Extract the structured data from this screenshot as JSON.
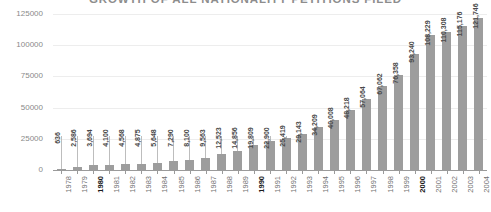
{
  "chart_data": {
    "type": "bar",
    "title": "GROWTH OF ALL NATIONALITY PETITIONS FILED",
    "xlabel": "",
    "ylabel": "",
    "ylim": [
      0,
      125000
    ],
    "yticks": [
      0,
      25000,
      50000,
      75000,
      100000,
      125000
    ],
    "ytick_labels": [
      "0",
      "25000",
      "50000",
      "75000",
      "100000",
      "125000"
    ],
    "grid": true,
    "legend": "none",
    "bar_color": "#9d9d9d",
    "categories": [
      "1978",
      "1979",
      "1980",
      "1981",
      "1982",
      "1983",
      "1984",
      "1985",
      "1986",
      "1987",
      "1988",
      "1989",
      "1990",
      "1991",
      "1992",
      "1993",
      "1994",
      "1995",
      "1996",
      "1997",
      "1998",
      "1999",
      "2000",
      "2001",
      "2002",
      "2003",
      "2004"
    ],
    "emphasized_categories": [
      "1980",
      "1990",
      "2000"
    ],
    "values": [
      636,
      2586,
      3694,
      4100,
      4568,
      4875,
      5648,
      7290,
      8100,
      9563,
      12523,
      14856,
      19809,
      22900,
      25419,
      29143,
      34209,
      40008,
      48218,
      57064,
      67062,
      76358,
      93240,
      108229,
      110308,
      115176,
      121746
    ],
    "value_labels": [
      "636",
      "2,586",
      "3,694",
      "4,100",
      "4,568",
      "4,875",
      "5,648",
      "7,290",
      "8,100",
      "9,563",
      "12,523",
      "14,856",
      "19,809",
      "22,900",
      "25,419",
      "29,143",
      "34,209",
      "40,008",
      "48,218",
      "57,064",
      "67,062",
      "76,358",
      "93,240",
      "108,229",
      "110,308",
      "115,176",
      "121,746"
    ]
  }
}
